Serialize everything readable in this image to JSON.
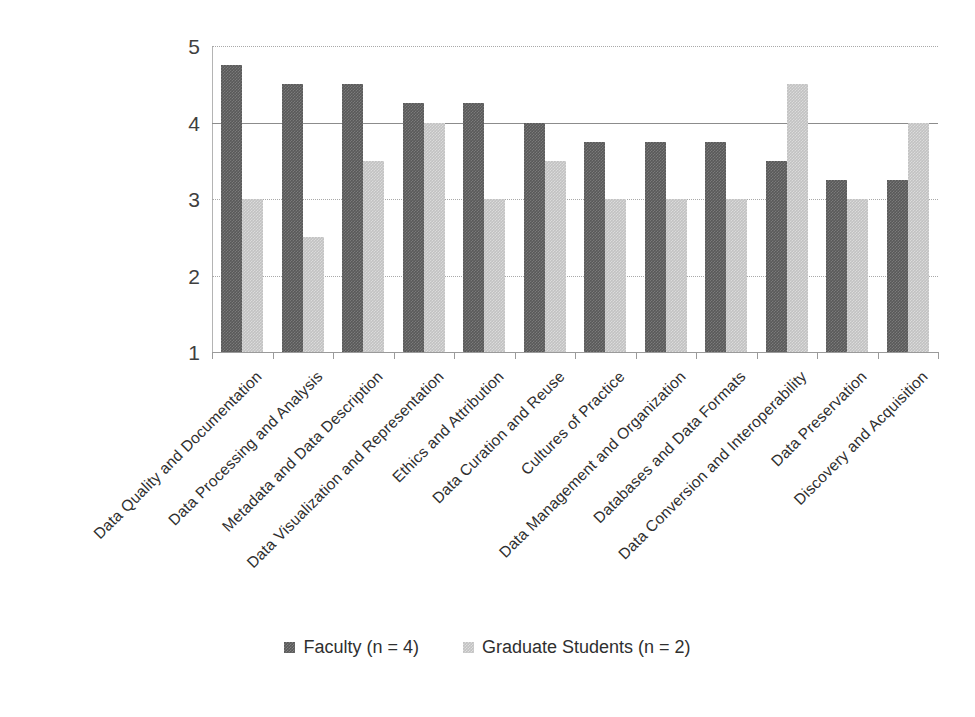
{
  "chart_data": {
    "type": "bar",
    "title": "",
    "subtitle": "",
    "xlabel": "",
    "ylabel": "",
    "ylim": [
      1,
      5
    ],
    "ytick_labels": [
      "5",
      "4",
      "3",
      "2",
      "1"
    ],
    "ytick_values": [
      5,
      4,
      3,
      2,
      1
    ],
    "grid": true,
    "legend_position": "bottom-center",
    "orientation": "vertical",
    "grouping": "grouped",
    "categories": [
      "Data Quality and Documentation",
      "Data Processing and Analysis",
      "Metadata and Data Description",
      "Data Visualization and Representation",
      "Ethics and Attribution",
      "Data Curation and Reuse",
      "Cultures of Practice",
      "Data Management and Organization",
      "Databases and Data Formats",
      "Data Conversion and Interoperability",
      "Data Preservation",
      "Discovery and Acquisition"
    ],
    "series": [
      {
        "name": "Faculty (n = 4)",
        "color": "#595959",
        "values": [
          4.75,
          4.5,
          4.5,
          4.25,
          4.25,
          4.0,
          3.75,
          3.75,
          3.75,
          3.5,
          3.25,
          3.25
        ]
      },
      {
        "name": "Graduate Students (n = 2)",
        "color": "#c2c2c2",
        "values": [
          3.0,
          2.5,
          3.5,
          4.0,
          3.0,
          3.5,
          3.0,
          3.0,
          3.0,
          4.5,
          3.0,
          4.0
        ]
      }
    ]
  },
  "legend": {
    "entries": [
      {
        "label": "Faculty (n = 4)"
      },
      {
        "label": "Graduate Students (n = 2)"
      }
    ]
  }
}
